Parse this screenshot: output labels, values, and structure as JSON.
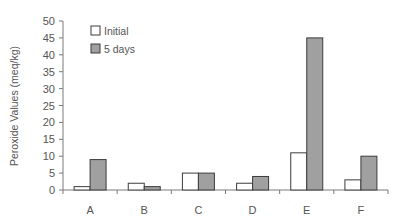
{
  "chart_data": {
    "type": "bar",
    "title": "",
    "xlabel": "",
    "ylabel": "Peroxide Values (meq/kg)",
    "categories": [
      "A",
      "B",
      "C",
      "D",
      "E",
      "F"
    ],
    "series": [
      {
        "name": "Initial",
        "values": [
          1,
          2,
          5,
          2,
          11,
          3
        ],
        "color": "#ffffff"
      },
      {
        "name": "5 days",
        "values": [
          9,
          1,
          5,
          4,
          45,
          10
        ],
        "color": "#a0a0a0"
      }
    ],
    "ylim": [
      0,
      50
    ],
    "yticks": [
      0,
      5,
      10,
      15,
      20,
      25,
      30,
      35,
      40,
      45,
      50
    ],
    "grid": false,
    "legend_position": "upper-left-inside"
  }
}
